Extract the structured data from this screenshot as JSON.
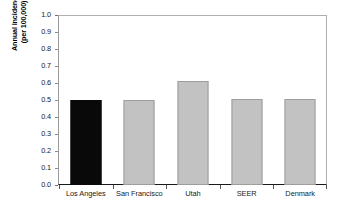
{
  "chart_data": {
    "type": "bar",
    "title": "",
    "subtitle": "",
    "xlabel": "",
    "ylabel_line1": "Annual incidence",
    "ylabel_line2": "(per 100,000)",
    "categories": [
      "Los Angeles",
      "San Francisco",
      "Utah",
      "SEER",
      "Denmark"
    ],
    "values": [
      0.5,
      0.5,
      0.61,
      0.505,
      0.505
    ],
    "series": [
      {
        "name": "Annual incidence (per 100,000)",
        "values": [
          0.5,
          0.5,
          0.61,
          0.505,
          0.505
        ]
      }
    ],
    "bar_colors": [
      "#090909",
      "#c2c2c2",
      "#c2c2c2",
      "#c2c2c2",
      "#c2c2c2"
    ],
    "bar_border_colors": [
      "#090909",
      "#9d9d9d",
      "#9d9d9d",
      "#9d9d9d",
      "#9d9d9d"
    ],
    "highlighted_category": "Los Angeles",
    "ylim": [
      0.0,
      1.0
    ],
    "ytick_step": 0.1,
    "ytick_labels": [
      "1.0",
      "0.9",
      "0.8",
      "0.7",
      "0.6",
      "0.5",
      "0.4",
      "0.3",
      "0.2",
      "0.1",
      "0.0"
    ],
    "ytick_values": [
      1.0,
      0.9,
      0.8,
      0.7,
      0.6,
      0.5,
      0.4,
      0.3,
      0.2,
      0.1,
      0.0
    ],
    "grid": false,
    "legend": null,
    "legend_position": "none",
    "annotations": [],
    "background_color": "#ffffff",
    "axis_color": "#1a1a1a",
    "frame_color": "#b0b0b0"
  }
}
